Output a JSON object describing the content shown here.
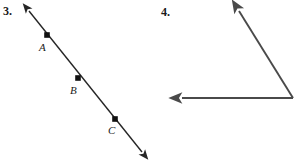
{
  "page": {
    "background_color": "#ffffff",
    "width": 294,
    "height": 163
  },
  "figures": [
    {
      "number_label": "3.",
      "kind": "line-with-points",
      "description": "A straight line with arrowheads on both ends passing through three labeled points",
      "stroke_color": "#262626",
      "stroke_width": 1.4,
      "line": {
        "start": {
          "x": 26,
          "y": 7
        },
        "end": {
          "x": 145,
          "y": 156
        }
      },
      "arrowheads": [
        "start",
        "end"
      ],
      "points": [
        {
          "label": "A",
          "x": 47,
          "y": 35,
          "label_x": 39,
          "label_y": 42
        },
        {
          "label": "B",
          "x": 78,
          "y": 78,
          "label_x": 70,
          "label_y": 85
        },
        {
          "label": "C",
          "x": 115,
          "y": 119,
          "label_x": 108,
          "label_y": 125
        }
      ]
    },
    {
      "number_label": "4.",
      "kind": "angle",
      "description": "An angle formed by two rays meeting at a vertex near the right edge",
      "stroke_color": "#4a4a4a",
      "stroke_width": 1.9,
      "vertex": {
        "x": 293,
        "y": 98
      },
      "rays": [
        {
          "name": "upper-diagonal-ray",
          "from": {
            "x": 293,
            "y": 98
          },
          "to": {
            "x": 236,
            "y": 6
          }
        },
        {
          "name": "horizontal-ray",
          "from": {
            "x": 293,
            "y": 98
          },
          "to": {
            "x": 176,
            "y": 98
          }
        }
      ]
    }
  ]
}
